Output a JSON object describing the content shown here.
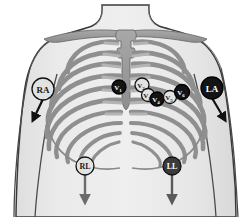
{
  "diagram": {
    "background_color": "#ffffff",
    "skin_fill": "#e9e9e9",
    "skin_outline": "#3a3a3a",
    "bone_fill": "#9a9a9a",
    "bone_outline": "#6d6d6d",
    "badge_light_fill": "#e2e2e2",
    "badge_dark_fill": "#141414",
    "badge_light_text": "#1a1a1a",
    "badge_dark_text": "#ffffff",
    "arrow_dark": "#111111",
    "arrow_gray": "#6b6b6b"
  },
  "limb_electrodes": [
    {
      "id": "ra",
      "label": "RA",
      "name": "right-arm-electrode",
      "style": "light",
      "cx": 43,
      "cy": 89,
      "r": 11,
      "arrow_to_x": 33,
      "arrow_to_y": 120,
      "arrow_color": "#111111",
      "font_size": 9
    },
    {
      "id": "la",
      "label": "LA",
      "name": "left-arm-electrode",
      "style": "dark",
      "cx": 212,
      "cy": 88,
      "r": 11,
      "arrow_to_x": 225,
      "arrow_to_y": 120,
      "arrow_color": "#111111",
      "font_size": 9
    },
    {
      "id": "rl",
      "label": "RL",
      "name": "right-leg-electrode",
      "style": "light",
      "cx": 85,
      "cy": 166,
      "r": 9,
      "arrow_to_x": 85,
      "arrow_to_y": 202,
      "arrow_color": "#6b6b6b",
      "font_size": 8
    },
    {
      "id": "ll",
      "label": "LL",
      "name": "left-leg-electrode",
      "style": "dark-gray",
      "cx": 172,
      "cy": 166,
      "r": 9,
      "arrow_to_x": 172,
      "arrow_to_y": 202,
      "arrow_color": "#5a5a5a",
      "font_size": 8
    }
  ],
  "precordial_electrodes": [
    {
      "id": "v1",
      "label": "V",
      "sub": "1",
      "name": "precordial-electrode-v1",
      "style": "dark",
      "cx": 119,
      "cy": 87,
      "r": 7.0,
      "font_size": 7
    },
    {
      "id": "v2",
      "label": "V",
      "sub": "2",
      "name": "precordial-electrode-v2",
      "style": "light",
      "cx": 142,
      "cy": 85,
      "r": 7.0,
      "font_size": 7
    },
    {
      "id": "v3",
      "label": "V",
      "sub": "3",
      "name": "precordial-electrode-v3",
      "style": "light",
      "cx": 148,
      "cy": 95,
      "r": 6.5,
      "font_size": 7
    },
    {
      "id": "v4",
      "label": "V",
      "sub": "4",
      "name": "precordial-electrode-v4",
      "style": "dark",
      "cx": 157,
      "cy": 99,
      "r": 7.0,
      "font_size": 7
    },
    {
      "id": "v5",
      "label": "V",
      "sub": "5",
      "name": "precordial-electrode-v5",
      "style": "light",
      "cx": 170,
      "cy": 97,
      "r": 6.5,
      "font_size": 7
    },
    {
      "id": "v6",
      "label": "V",
      "sub": "6",
      "name": "precordial-electrode-v6",
      "style": "dark",
      "cx": 182,
      "cy": 92,
      "r": 7.5,
      "font_size": 7
    }
  ],
  "anatomy": {
    "clavicle_left_label": "left-clavicle",
    "clavicle_right_label": "right-clavicle",
    "sternum_label": "sternum",
    "rib_pairs": 10,
    "torso_label": "torso-outline",
    "arm_left_label": "left-arm",
    "arm_right_label": "right-arm",
    "neck_label": "neck"
  }
}
